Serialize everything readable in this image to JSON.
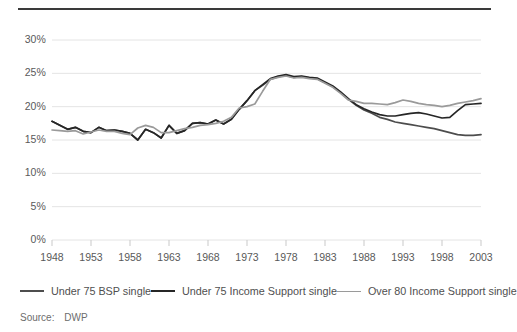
{
  "figure": {
    "source_label": "Source:",
    "source_value": "DWP"
  },
  "axes": {
    "y_ticks": [
      "0%",
      "5%",
      "10%",
      "15%",
      "20%",
      "25%",
      "30%"
    ],
    "x_ticks": [
      "1948",
      "1953",
      "1958",
      "1963",
      "1968",
      "1973",
      "1978",
      "1983",
      "1988",
      "1993",
      "1998",
      "2003"
    ]
  },
  "legend": {
    "items": [
      {
        "label": "Under 75 BSP single",
        "color": "#4d4d4d"
      },
      {
        "label": "Under 75 Income Support single",
        "color": "#262626"
      },
      {
        "label": "Over 80 Income Support single",
        "color": "#9a9a9a"
      }
    ]
  },
  "chart_data": {
    "type": "line",
    "title": "",
    "xlabel": "",
    "ylabel": "",
    "xlim": [
      1948,
      2003
    ],
    "ylim": [
      0,
      30
    ],
    "y_unit": "%",
    "grid": "horizontal",
    "legend_position": "below",
    "x": [
      1948,
      1949,
      1950,
      1951,
      1952,
      1953,
      1954,
      1955,
      1956,
      1957,
      1958,
      1959,
      1960,
      1961,
      1962,
      1963,
      1964,
      1965,
      1966,
      1967,
      1968,
      1969,
      1970,
      1971,
      1972,
      1973,
      1974,
      1975,
      1976,
      1977,
      1978,
      1979,
      1980,
      1981,
      1982,
      1983,
      1984,
      1985,
      1986,
      1987,
      1988,
      1989,
      1990,
      1991,
      1992,
      1993,
      1994,
      1995,
      1996,
      1997,
      1998,
      1999,
      2000,
      2001,
      2002,
      2003
    ],
    "series": [
      {
        "name": "Under 75 BSP single",
        "color": "#4d4d4d",
        "values": [
          17.8,
          17.2,
          16.6,
          16.9,
          16.3,
          16.1,
          16.9,
          16.4,
          16.5,
          16.3,
          16.0,
          15.0,
          16.6,
          16.1,
          15.3,
          17.2,
          16.0,
          16.4,
          17.5,
          17.6,
          17.4,
          18.0,
          17.4,
          18.1,
          19.6,
          20.9,
          22.4,
          23.2,
          24.1,
          24.5,
          24.7,
          24.4,
          24.5,
          24.3,
          24.2,
          23.6,
          23.0,
          22.1,
          21.1,
          20.2,
          19.5,
          19.0,
          18.4,
          18.1,
          17.7,
          17.5,
          17.3,
          17.1,
          16.9,
          16.7,
          16.4,
          16.1,
          15.8,
          15.7,
          15.7,
          15.8
        ]
      },
      {
        "name": "Under 75 Income Support single",
        "color": "#262626",
        "values": [
          17.8,
          17.2,
          16.6,
          16.9,
          16.3,
          16.1,
          16.9,
          16.4,
          16.5,
          16.3,
          16.0,
          15.0,
          16.6,
          16.1,
          15.3,
          17.2,
          16.0,
          16.4,
          17.5,
          17.6,
          17.4,
          18.0,
          17.4,
          18.1,
          19.6,
          20.9,
          22.4,
          23.3,
          24.2,
          24.6,
          24.8,
          24.5,
          24.6,
          24.4,
          24.3,
          23.7,
          23.1,
          22.2,
          21.2,
          20.3,
          19.7,
          19.2,
          18.8,
          18.6,
          18.6,
          18.8,
          19.0,
          19.1,
          18.9,
          18.6,
          18.3,
          18.4,
          19.4,
          20.3,
          20.4,
          20.5
        ]
      },
      {
        "name": "Over 80 Income Support single",
        "color": "#9a9a9a",
        "values": [
          16.5,
          16.4,
          16.3,
          16.4,
          15.9,
          16.2,
          16.5,
          16.3,
          16.3,
          16.0,
          15.8,
          16.8,
          17.2,
          16.9,
          16.1,
          16.1,
          16.4,
          16.7,
          16.9,
          17.2,
          17.3,
          17.5,
          17.8,
          18.4,
          19.8,
          20.0,
          20.4,
          22.3,
          24.1,
          24.4,
          24.6,
          24.3,
          24.4,
          24.2,
          24.1,
          23.5,
          22.9,
          22.0,
          21.0,
          20.8,
          20.5,
          20.5,
          20.4,
          20.3,
          20.6,
          21.0,
          20.8,
          20.5,
          20.3,
          20.2,
          20.0,
          20.2,
          20.5,
          20.7,
          20.9,
          21.2
        ]
      }
    ]
  }
}
